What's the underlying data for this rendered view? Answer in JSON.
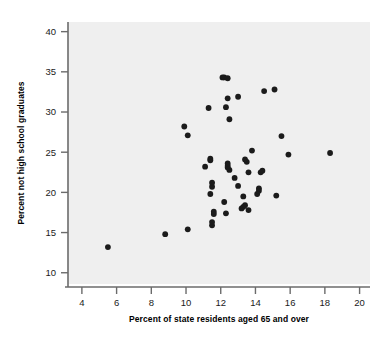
{
  "chart_data": {
    "type": "scatter",
    "title": "",
    "xlabel": "Percent of state residents aged 65 and over",
    "ylabel": "Percent not high school graduates",
    "xlim": [
      3.2,
      20.6
    ],
    "ylim": [
      8.6,
      41.2
    ],
    "xticks": [
      4,
      6,
      8,
      10,
      12,
      14,
      16,
      18,
      20
    ],
    "xtick_labels": [
      "4",
      "6",
      "8",
      "10",
      "12",
      "14",
      "16",
      "18",
      "20"
    ],
    "yticks": [
      10,
      15,
      20,
      25,
      30,
      35,
      40
    ],
    "ytick_labels": [
      "10",
      "15",
      "20",
      "25",
      "30",
      "35",
      "40"
    ],
    "grid": false,
    "legend": null,
    "marker": "filled-circle",
    "marker_color": "#1b1b1b",
    "plot_bg_color": "#efefef",
    "figure_bg_color": "#ffffff",
    "axis_color": "#6b6b6b",
    "n_points": 51,
    "points": [
      {
        "x": 5.5,
        "y": 13.2
      },
      {
        "x": 8.8,
        "y": 14.8
      },
      {
        "x": 10.1,
        "y": 15.4
      },
      {
        "x": 11.5,
        "y": 15.9
      },
      {
        "x": 11.5,
        "y": 16.3
      },
      {
        "x": 11.6,
        "y": 17.3
      },
      {
        "x": 11.6,
        "y": 17.6
      },
      {
        "x": 12.3,
        "y": 17.4
      },
      {
        "x": 13.6,
        "y": 17.8
      },
      {
        "x": 13.2,
        "y": 18.0
      },
      {
        "x": 13.3,
        "y": 18.2
      },
      {
        "x": 13.4,
        "y": 18.4
      },
      {
        "x": 12.2,
        "y": 18.8
      },
      {
        "x": 13.3,
        "y": 19.5
      },
      {
        "x": 14.1,
        "y": 19.8
      },
      {
        "x": 11.4,
        "y": 19.8
      },
      {
        "x": 15.2,
        "y": 19.6
      },
      {
        "x": 14.2,
        "y": 20.2
      },
      {
        "x": 14.2,
        "y": 20.5
      },
      {
        "x": 13.0,
        "y": 20.8
      },
      {
        "x": 11.5,
        "y": 20.7
      },
      {
        "x": 11.5,
        "y": 21.2
      },
      {
        "x": 12.8,
        "y": 21.8
      },
      {
        "x": 13.6,
        "y": 22.5
      },
      {
        "x": 14.3,
        "y": 22.5
      },
      {
        "x": 14.4,
        "y": 22.7
      },
      {
        "x": 12.5,
        "y": 22.8
      },
      {
        "x": 12.4,
        "y": 23.1
      },
      {
        "x": 12.4,
        "y": 23.3
      },
      {
        "x": 11.1,
        "y": 23.2
      },
      {
        "x": 13.5,
        "y": 23.8
      },
      {
        "x": 13.4,
        "y": 24.1
      },
      {
        "x": 11.4,
        "y": 24.0
      },
      {
        "x": 11.4,
        "y": 24.2
      },
      {
        "x": 12.4,
        "y": 23.6
      },
      {
        "x": 13.8,
        "y": 25.2
      },
      {
        "x": 15.9,
        "y": 24.7
      },
      {
        "x": 18.3,
        "y": 24.9
      },
      {
        "x": 10.1,
        "y": 27.1
      },
      {
        "x": 15.5,
        "y": 27.0
      },
      {
        "x": 9.9,
        "y": 28.2
      },
      {
        "x": 12.5,
        "y": 29.1
      },
      {
        "x": 11.3,
        "y": 30.5
      },
      {
        "x": 12.3,
        "y": 30.6
      },
      {
        "x": 12.4,
        "y": 31.7
      },
      {
        "x": 13.0,
        "y": 31.9
      },
      {
        "x": 14.5,
        "y": 32.6
      },
      {
        "x": 15.1,
        "y": 32.8
      },
      {
        "x": 12.1,
        "y": 34.3
      },
      {
        "x": 12.2,
        "y": 34.3
      },
      {
        "x": 12.4,
        "y": 34.2
      }
    ]
  }
}
